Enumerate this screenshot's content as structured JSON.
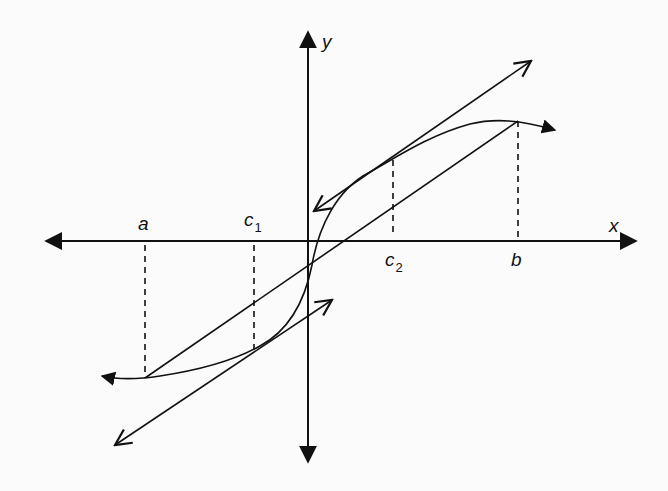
{
  "diagram": {
    "axes": {
      "x_label": "x",
      "y_label": "y"
    },
    "points": [
      {
        "name": "a",
        "label": "a"
      },
      {
        "name": "c1",
        "label": "c",
        "subscript": "1"
      },
      {
        "name": "c2",
        "label": "c",
        "subscript": "2"
      },
      {
        "name": "b",
        "label": "b"
      }
    ],
    "elements": {
      "curve": "cubic-like curve from (a, f(a)) to (b, f(b)) with arrows at both ends",
      "secant": "secant line from (a, f(a)) to (b, f(b))",
      "tangent_c1": "tangent line at c1 parallel to secant, arrows both ends",
      "tangent_c2": "tangent line at c2 parallel to secant, arrows both ends",
      "dashed_lines": "vertical dashed lines at a, c1, c2, b"
    },
    "colors": {
      "stroke": "#111111",
      "background": "#fbfbfb"
    }
  }
}
